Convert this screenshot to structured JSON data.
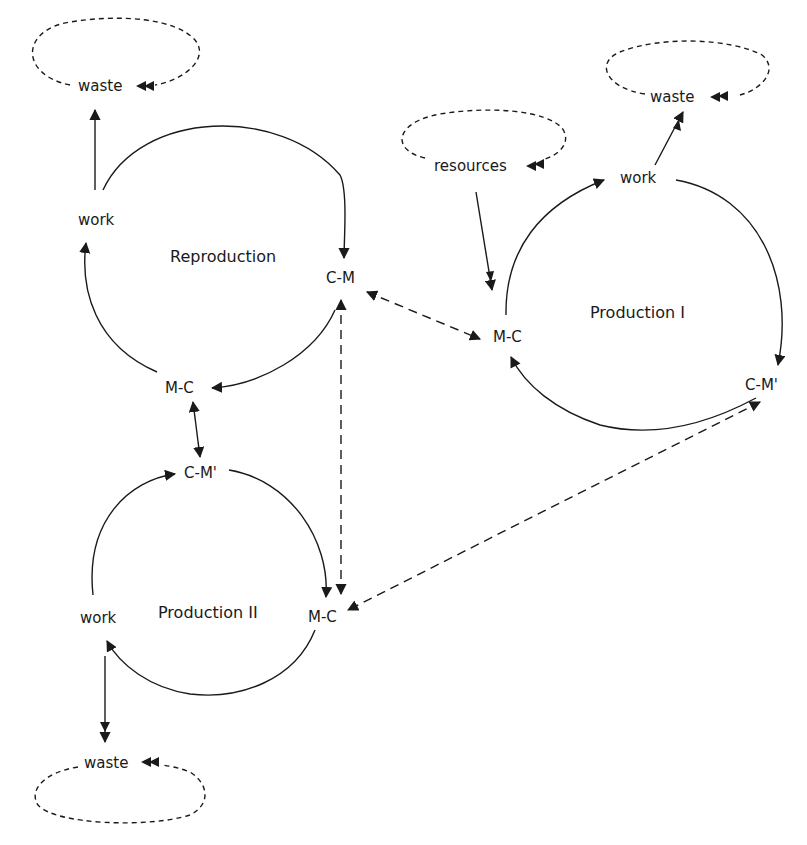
{
  "diagram": {
    "cycles": {
      "reproduction": {
        "title": "Reproduction",
        "nodes": {
          "work": "work",
          "cm": "C-M",
          "mc": "M-C"
        }
      },
      "production1": {
        "title": "Production I",
        "nodes": {
          "work": "work",
          "cm": "C-M'",
          "mc": "M-C"
        }
      },
      "production2": {
        "title": "Production II",
        "nodes": {
          "work": "work",
          "cm": "C-M'",
          "mc": "M-C"
        }
      }
    },
    "pools": {
      "waste_top_left": "waste",
      "waste_top_right": "waste",
      "resources": "resources",
      "waste_bottom": "waste"
    },
    "links": [
      {
        "from": "Reproduction C-M",
        "to": "Production I M-C",
        "style": "dashed",
        "direction": "both"
      },
      {
        "from": "Reproduction C-M",
        "to": "Production II M-C",
        "style": "dashed",
        "direction": "both"
      },
      {
        "from": "Production I C-M'",
        "to": "Production II M-C",
        "style": "dashed",
        "direction": "both"
      },
      {
        "from": "Reproduction M-C",
        "to": "Production II C-M'",
        "style": "solid",
        "direction": "both"
      },
      {
        "from": "resources",
        "to": "Production I M-C",
        "style": "solid",
        "direction": "one"
      },
      {
        "from": "Reproduction work",
        "to": "waste",
        "style": "solid",
        "direction": "one"
      },
      {
        "from": "Production I work",
        "to": "waste",
        "style": "solid",
        "direction": "one"
      },
      {
        "from": "Production II work",
        "to": "waste",
        "style": "solid",
        "direction": "one"
      }
    ],
    "colors": {
      "ink": "#1a1a1a",
      "background": "#ffffff"
    }
  }
}
